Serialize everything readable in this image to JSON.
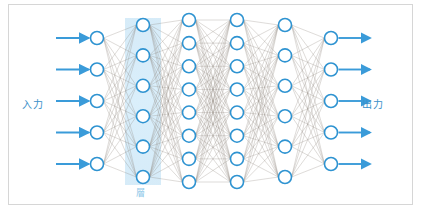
{
  "figure": {
    "title_visible": false,
    "background_color": "#ffffff",
    "frame_border_color": "#d6d6d6"
  },
  "labels": {
    "input": "入力",
    "output": "出力",
    "highlighted_layer": "層",
    "input_color": "#3a8fc9",
    "output_color": "#3a8fc9",
    "layer_color": "#8cc7e8"
  },
  "colors": {
    "node_stroke": "#2e93d1",
    "node_fill": "#ffffff",
    "arrow": "#3a9bd9",
    "edge": "#8a8278",
    "highlight_band": "#cfe8f7"
  },
  "chart_data": {
    "type": "diagram",
    "subtype": "neural-network",
    "title": "",
    "xlabel": "",
    "ylabel": "",
    "layers": [
      {
        "name": "input-layer",
        "index": 0,
        "node_count": 5,
        "x": 97,
        "highlighted": false
      },
      {
        "name": "hidden-layer-1",
        "index": 1,
        "node_count": 6,
        "x": 143,
        "highlighted": true
      },
      {
        "name": "hidden-layer-2",
        "index": 2,
        "node_count": 8,
        "x": 189,
        "highlighted": false
      },
      {
        "name": "hidden-layer-3",
        "index": 3,
        "node_count": 8,
        "x": 237,
        "highlighted": false
      },
      {
        "name": "hidden-layer-4",
        "index": 4,
        "node_count": 6,
        "x": 285,
        "highlighted": false
      },
      {
        "name": "output-layer",
        "index": 5,
        "node_count": 5,
        "x": 331,
        "highlighted": false
      }
    ],
    "node_radius": 6.5,
    "highlighted_layer_index": 1,
    "fully_connected": true,
    "input_arrows": 5,
    "output_arrows": 5,
    "legend": [],
    "annotations": [
      {
        "text": "入力",
        "position": "left"
      },
      {
        "text": "出力",
        "position": "right"
      },
      {
        "text": "層",
        "position": "below-hidden-layer-1"
      }
    ]
  }
}
